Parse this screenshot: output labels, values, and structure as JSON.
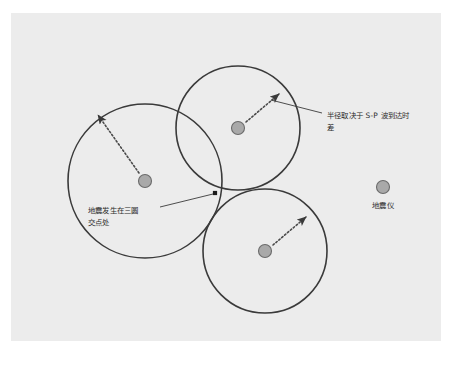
{
  "figure": {
    "panel": {
      "background_color": "#ececec",
      "outer_background_color": "#ffffff",
      "x": 11,
      "y": 13,
      "width": 430,
      "height": 328
    },
    "style": {
      "circle_stroke_color": "#3a3a3a",
      "dot_fill_color": "#a9a9a9",
      "dot_stroke_color": "#6b6b6b",
      "arrow_color": "#3a3a3a",
      "leader_color": "#3a3a3a",
      "epicenter_color": "#1a1a1a",
      "text_color": "#2b2b2b"
    },
    "circles": [
      {
        "id": "circle-left",
        "name": "左侧台站范围圆",
        "cx": 145,
        "cy": 181,
        "r": 77,
        "dot_r": 6.5,
        "arrow": {
          "x1": 139,
          "y1": 173,
          "x2": 96,
          "y2": 112
        }
      },
      {
        "id": "circle-top",
        "name": "上方台站范围圆",
        "cx": 238,
        "cy": 128,
        "r": 62,
        "dot_r": 6.5,
        "arrow": {
          "x1": 246,
          "y1": 122,
          "x2": 281,
          "y2": 92
        }
      },
      {
        "id": "circle-bottom",
        "name": "下方台站范围圆",
        "cx": 265,
        "cy": 251,
        "r": 62,
        "dot_r": 6.5,
        "arrow": {
          "x1": 273,
          "y1": 245,
          "x2": 308,
          "y2": 215
        }
      }
    ],
    "epicenter": {
      "name": "三圆交点",
      "x": 215,
      "y": 193,
      "size": 4.2
    },
    "annotations": [
      {
        "id": "anno-radius",
        "name": "半径说明",
        "lines": [
          "半径取决于 S-P 波到达时",
          "差"
        ],
        "text_x": 327,
        "text_y": 118,
        "line_height": 12,
        "leader": {
          "x1": 322,
          "y1": 113,
          "x2": 271,
          "y2": 100
        }
      },
      {
        "id": "anno-epicenter",
        "name": "震中说明",
        "lines": [
          "地震发生在三圆",
          "交点处"
        ],
        "text_x": 88,
        "text_y": 213,
        "line_height": 12,
        "leader": {
          "x1": 160,
          "y1": 207,
          "x2": 212,
          "y2": 195
        }
      }
    ],
    "station_legend": {
      "id": "legend-seismograph",
      "name": "地震仪图例",
      "label": "地震仪",
      "dot_cx": 383,
      "dot_cy": 187,
      "dot_r": 6.5,
      "label_x": 383,
      "label_y": 208
    }
  }
}
